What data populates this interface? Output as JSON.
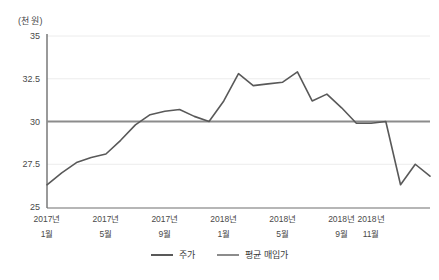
{
  "chart_data": {
    "type": "line",
    "title": "",
    "unit_label": "(천 원)",
    "xlabel": "",
    "ylabel": "",
    "ylim": [
      25,
      35
    ],
    "ytick_values": [
      25,
      27.5,
      30,
      32.5,
      35
    ],
    "ytick_labels": [
      "25",
      "27.5",
      "30",
      "32.5",
      "35"
    ],
    "grid": true,
    "legend_position": "bottom-center",
    "x": [
      "2017-01",
      "2017-02",
      "2017-03",
      "2017-04",
      "2017-05",
      "2017-06",
      "2017-07",
      "2017-08",
      "2017-09",
      "2017-10",
      "2017-11",
      "2017-12",
      "2018-01",
      "2018-02",
      "2018-03",
      "2018-04",
      "2018-05",
      "2018-06",
      "2018-07",
      "2018-08",
      "2018-09",
      "2018-10",
      "2018-11",
      "2018-12"
    ],
    "xticks": [
      {
        "index": 0,
        "year": "2017년",
        "month": "1월"
      },
      {
        "index": 4,
        "year": "2017년",
        "month": "5월"
      },
      {
        "index": 8,
        "year": "2017년",
        "month": "9월"
      },
      {
        "index": 12,
        "year": "2018년",
        "month": "1월"
      },
      {
        "index": 16,
        "year": "2018년",
        "month": "5월"
      },
      {
        "index": 20,
        "year": "2018년",
        "month": "9월"
      },
      {
        "index": 22,
        "year": "2018년",
        "month": "11월"
      }
    ],
    "series": [
      {
        "name": "주가",
        "color": "#595959",
        "values": [
          26.3,
          27.0,
          27.6,
          27.9,
          28.1,
          28.9,
          29.8,
          30.4,
          30.6,
          30.7,
          30.3,
          30.0,
          31.2,
          32.8,
          32.1,
          32.2,
          32.3,
          32.9,
          31.2,
          31.6,
          30.8,
          29.9,
          29.9,
          30.0
        ]
      },
      {
        "name": "평균 매입가",
        "color": "#8c8c8c",
        "constant": 30.0,
        "values": [
          30.0,
          30.0,
          30.0,
          30.0,
          30.0,
          30.0,
          30.0,
          30.0,
          30.0,
          30.0,
          30.0,
          30.0,
          30.0,
          30.0,
          30.0,
          30.0,
          30.0,
          30.0,
          30.0,
          30.0,
          30.0,
          30.0,
          30.0,
          30.0
        ]
      }
    ],
    "tail_segment": {
      "note": "stock price after 2018-12 reference tick",
      "values": [
        26.3,
        27.5,
        26.8
      ]
    },
    "annotations": []
  },
  "legend": {
    "items": [
      {
        "label": "주가",
        "color": "#595959"
      },
      {
        "label": "평균 매입가",
        "color": "#8c8c8c"
      }
    ]
  },
  "axis": {
    "unit": "(천 원)"
  }
}
